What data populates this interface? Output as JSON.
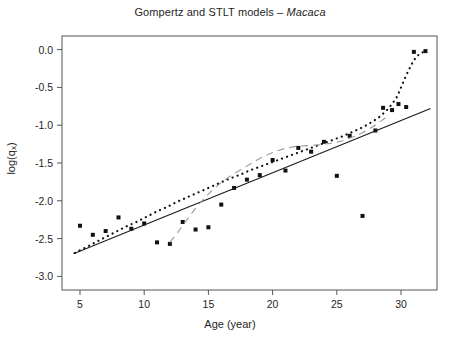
{
  "chart_data": {
    "type": "scatter",
    "title": "Gompertz and STLT models – Macaca",
    "title_prefix": "Gompertz and STLT models – ",
    "title_species": "Macaca",
    "xlabel": "Age (year)",
    "ylabel_main": "log(q",
    "ylabel_sub": "x",
    "ylabel_close": ")",
    "ylabel": "log(q_x)",
    "xlim": [
      3.6,
      32.8
    ],
    "ylim": [
      -3.18,
      0.18
    ],
    "xticks": [
      5,
      10,
      15,
      20,
      25,
      30
    ],
    "xtick_labels": [
      "5",
      "10",
      "15",
      "20",
      "25",
      "30"
    ],
    "yticks": [
      0.0,
      -0.5,
      -1.0,
      -1.5,
      -2.0,
      -2.5,
      -3.0
    ],
    "ytick_labels": [
      "0.0",
      "-0.5",
      "-1.0",
      "-1.5",
      "-2.0",
      "-2.5",
      "-3.0"
    ],
    "grid": false,
    "legend": null,
    "frame": true,
    "colors": {
      "points": "#111111",
      "gompertz_line": "#1a1a1a",
      "stlt_dotted": "#111111",
      "dashed_curve": "#9a9a9a",
      "axis": "#555555",
      "background": "#ffffff"
    },
    "series": [
      {
        "name": "observed",
        "type": "scatter",
        "marker": "square",
        "points": [
          [
            5.0,
            -2.33
          ],
          [
            6.0,
            -2.45
          ],
          [
            7.0,
            -2.4
          ],
          [
            8.0,
            -2.22
          ],
          [
            9.0,
            -2.37
          ],
          [
            10.0,
            -2.3
          ],
          [
            11.0,
            -2.55
          ],
          [
            12.0,
            -2.57
          ],
          [
            13.0,
            -2.28
          ],
          [
            14.0,
            -2.38
          ],
          [
            15.0,
            -2.35
          ],
          [
            16.0,
            -2.05
          ],
          [
            17.0,
            -1.83
          ],
          [
            18.0,
            -1.72
          ],
          [
            19.0,
            -1.66
          ],
          [
            20.0,
            -1.46
          ],
          [
            21.0,
            -1.6
          ],
          [
            22.0,
            -1.3
          ],
          [
            23.0,
            -1.35
          ],
          [
            24.0,
            -1.22
          ],
          [
            25.0,
            -1.67
          ],
          [
            26.0,
            -1.14
          ],
          [
            27.0,
            -2.2
          ],
          [
            28.0,
            -1.07
          ],
          [
            28.6,
            -0.77
          ],
          [
            29.3,
            -0.8
          ],
          [
            29.8,
            -0.72
          ],
          [
            30.4,
            -0.76
          ],
          [
            31.0,
            -0.03
          ],
          [
            31.9,
            -0.02
          ]
        ]
      },
      {
        "name": "Gompertz model (solid line)",
        "type": "line",
        "style": "solid",
        "endpoints": [
          [
            4.5,
            -2.7
          ],
          [
            32.3,
            -0.78
          ]
        ]
      },
      {
        "name": "STLT model (dotted curve)",
        "type": "line",
        "style": "dotted",
        "points": [
          [
            4.6,
            -2.69
          ],
          [
            5.4,
            -2.62
          ],
          [
            6.2,
            -2.55
          ],
          [
            7.0,
            -2.48
          ],
          [
            7.8,
            -2.41
          ],
          [
            8.6,
            -2.34
          ],
          [
            9.4,
            -2.28
          ],
          [
            10.2,
            -2.21
          ],
          [
            11.0,
            -2.14
          ],
          [
            11.8,
            -2.08
          ],
          [
            12.6,
            -2.01
          ],
          [
            13.4,
            -1.95
          ],
          [
            14.2,
            -1.89
          ],
          [
            15.0,
            -1.83
          ],
          [
            15.8,
            -1.77
          ],
          [
            16.6,
            -1.71
          ],
          [
            17.4,
            -1.66
          ],
          [
            18.2,
            -1.6
          ],
          [
            19.0,
            -1.55
          ],
          [
            19.8,
            -1.5
          ],
          [
            20.6,
            -1.45
          ],
          [
            21.4,
            -1.4
          ],
          [
            22.2,
            -1.35
          ],
          [
            23.0,
            -1.3
          ],
          [
            23.8,
            -1.25
          ],
          [
            24.6,
            -1.2
          ],
          [
            25.4,
            -1.15
          ],
          [
            26.2,
            -1.09
          ],
          [
            27.0,
            -1.03
          ],
          [
            27.8,
            -0.95
          ],
          [
            28.4,
            -0.88
          ],
          [
            28.9,
            -0.8
          ],
          [
            29.3,
            -0.72
          ],
          [
            29.7,
            -0.62
          ],
          [
            30.0,
            -0.5
          ],
          [
            30.3,
            -0.38
          ],
          [
            30.6,
            -0.27
          ],
          [
            30.9,
            -0.17
          ],
          [
            31.2,
            -0.09
          ],
          [
            31.6,
            -0.04
          ],
          [
            32.0,
            -0.02
          ]
        ]
      },
      {
        "name": "secondary model (dashed curve)",
        "type": "line",
        "style": "dashed",
        "points": [
          [
            12.0,
            -2.55
          ],
          [
            12.6,
            -2.42
          ],
          [
            13.2,
            -2.28
          ],
          [
            13.9,
            -2.12
          ],
          [
            14.6,
            -1.98
          ],
          [
            15.3,
            -1.86
          ],
          [
            16.0,
            -1.76
          ],
          [
            16.8,
            -1.66
          ],
          [
            17.6,
            -1.58
          ],
          [
            18.4,
            -1.5
          ],
          [
            19.2,
            -1.42
          ],
          [
            20.0,
            -1.36
          ],
          [
            20.9,
            -1.31
          ],
          [
            21.8,
            -1.28
          ],
          [
            22.7,
            -1.27
          ],
          [
            23.6,
            -1.26
          ],
          [
            24.5,
            -1.24
          ],
          [
            25.4,
            -1.21
          ],
          [
            26.2,
            -1.16
          ],
          [
            27.0,
            -1.1
          ],
          [
            27.8,
            -1.02
          ],
          [
            28.4,
            -0.95
          ],
          [
            28.8,
            -0.9
          ]
        ]
      }
    ]
  }
}
